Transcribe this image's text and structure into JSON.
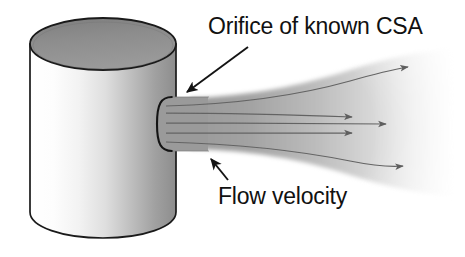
{
  "figure": {
    "kind": "technical-illustration",
    "background_color": "#ffffff",
    "width": 465,
    "height": 257
  },
  "labels": {
    "orifice": {
      "text": "Orifice of known CSA",
      "color": "#111111",
      "x": 208,
      "y": 34
    },
    "flow_velocity": {
      "text": "Flow velocity",
      "color": "#111111",
      "x": 218,
      "y": 204
    }
  },
  "annotations": {
    "orifice_pointer": {
      "name": "orifice-leader-arrow",
      "from_x": 248,
      "from_y": 47,
      "to_x": 184,
      "to_y": 94,
      "color": "#1a1a1a"
    },
    "flow_pointer": {
      "name": "flow-velocity-leader-arrow",
      "from_x": 228,
      "from_y": 180,
      "to_x": 209,
      "to_y": 157,
      "color": "#1a1a1a"
    }
  },
  "vessel": {
    "name": "cylinder",
    "top_ellipse_fill": "#8f8f8f",
    "top_ellipse_stroke": "#1a1a1a",
    "body_stroke": "#1a1a1a",
    "body_light": "#fbfbfb",
    "body_mid": "#e2e2e2",
    "body_dark": "#8a8a8a",
    "left_x": 30,
    "right_x": 176,
    "top_y": 18,
    "bottom_y": 238,
    "ellipse_ry": 26
  },
  "orifice_neck": {
    "name": "orifice-neck",
    "fill": "#9a9a9a",
    "stroke": "#1a1a1a",
    "x": 160,
    "y": 97,
    "width": 48,
    "height": 54
  },
  "jet": {
    "name": "expanding-jet",
    "fill_near": "#9c9c9c",
    "fill_far": "#fafafa",
    "throat_top_y": 99,
    "throat_bottom_y": 149,
    "exit_top_y": 56,
    "exit_bottom_y": 186,
    "start_x": 192,
    "end_x": 452
  },
  "streamlines": {
    "name": "streamline-set",
    "color": "#6a6a6a",
    "count": 5,
    "lines": [
      {
        "id": "streamline-top",
        "start_y": 106,
        "end_y": 67,
        "arrow_x": 413,
        "arrow_y": 67,
        "curve": "up"
      },
      {
        "id": "streamline-upper-mid",
        "start_y": 113,
        "end_y": 117,
        "arrow_x": 358,
        "arrow_y": 117,
        "curve": "flat"
      },
      {
        "id": "streamline-center",
        "start_y": 123,
        "end_y": 124,
        "arrow_x": 392,
        "arrow_y": 124,
        "curve": "flat"
      },
      {
        "id": "streamline-lower-mid",
        "start_y": 133,
        "end_y": 133,
        "arrow_x": 358,
        "arrow_y": 133,
        "curve": "flat"
      },
      {
        "id": "streamline-bottom",
        "start_y": 142,
        "end_y": 165,
        "arrow_x": 409,
        "arrow_y": 166,
        "curve": "down"
      }
    ]
  }
}
